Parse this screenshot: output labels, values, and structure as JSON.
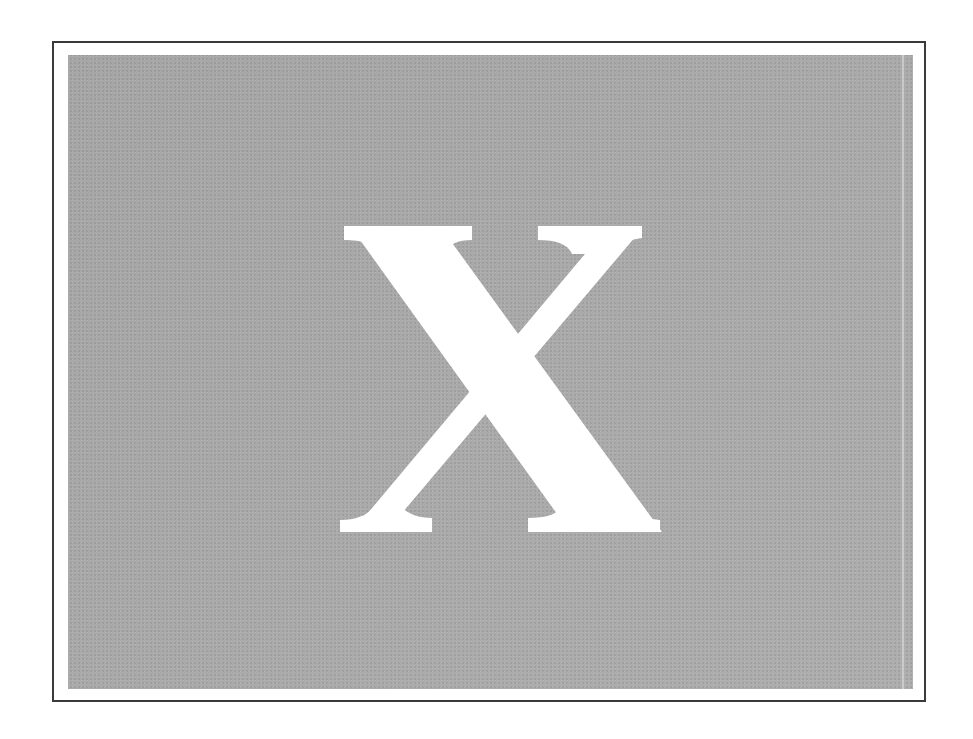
{
  "figure": {
    "glyph": "X",
    "glyph_color": "#ffffff",
    "panel_color": "#acacac",
    "frame_border_color": "#3a3a3a",
    "background_color": "#ffffff"
  }
}
